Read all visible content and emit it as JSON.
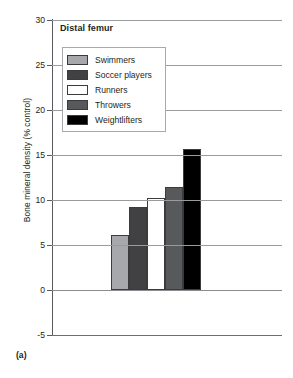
{
  "figure": {
    "panel_label": "(a)",
    "title": "Distal femur"
  },
  "axes": {
    "ylabel": "Bone mineral density (% control)",
    "xlabel": "",
    "yticks": [
      "30",
      "25",
      "20",
      "15",
      "10",
      "5",
      "0",
      "-5"
    ]
  },
  "legend": {
    "entries": [
      {
        "label": "Swimmers",
        "color": "#a6a8ab"
      },
      {
        "label": "Soccer players",
        "color": "#414042"
      },
      {
        "label": "Runners",
        "color": "#ffffff"
      },
      {
        "label": "Throwers",
        "color": "#58595b"
      },
      {
        "label": "Weightlifters",
        "color": "#000000"
      }
    ]
  },
  "chart_data": {
    "type": "bar",
    "title": "Distal femur",
    "xlabel": "",
    "ylabel": "Bone mineral density (% control)",
    "ylim": [
      -5,
      30
    ],
    "ytick_step": 5,
    "grid": true,
    "legend_position": "upper-left-inside",
    "categories": [
      "Swimmers",
      "Soccer players",
      "Runners",
      "Throwers",
      "Weightlifters"
    ],
    "values": [
      6.1,
      9.2,
      10.2,
      11.4,
      15.7
    ],
    "colors": [
      "#a6a8ab",
      "#414042",
      "#ffffff",
      "#58595b",
      "#000000"
    ]
  }
}
